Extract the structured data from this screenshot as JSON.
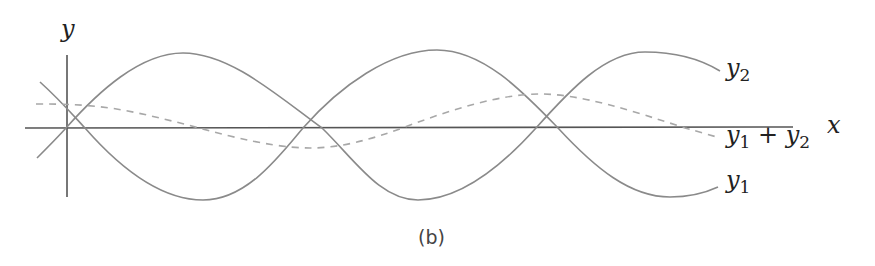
{
  "figure": {
    "caption": "(b)",
    "axes": {
      "x_label": "x",
      "y_label": "y"
    },
    "curves": [
      {
        "name": "y1",
        "label_base": "y",
        "label_sub": "1",
        "style": "solid",
        "color": "#8a8a8a"
      },
      {
        "name": "y2",
        "label_base": "y",
        "label_sub": "2",
        "style": "solid",
        "color": "#8a8a8a"
      },
      {
        "name": "y1 + y2",
        "label_base1": "y",
        "label_sub1": "1",
        "label_op": " + ",
        "label_base2": "y",
        "label_sub2": "2",
        "style": "dashed",
        "color": "#a8a8a8"
      }
    ],
    "colors": {
      "axis": "#555555",
      "curve": "#8a8a8a",
      "dashed": "#a8a8a8",
      "text": "#222222"
    }
  }
}
